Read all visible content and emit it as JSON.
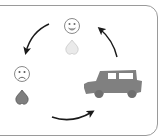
{
  "diagram": {
    "title": "",
    "nodes": [
      {
        "id": "happy",
        "label": "",
        "icons": [
          "smiley-face-icon",
          "heart-icon"
        ],
        "heart_color": "#e6e6e6",
        "position": "top"
      },
      {
        "id": "sad",
        "label": "",
        "icons": [
          "sad-face-icon",
          "heart-icon"
        ],
        "heart_color": "#7a7a7a",
        "position": "left"
      },
      {
        "id": "jeep",
        "label": "",
        "icons": [
          "jeep-icon"
        ],
        "vehicle_color": "#808080",
        "position": "right"
      }
    ],
    "edges": [
      {
        "from": "happy",
        "to": "sad",
        "direction": "counter-clockwise"
      },
      {
        "from": "sad",
        "to": "jeep"
      },
      {
        "from": "jeep",
        "to": "happy"
      }
    ],
    "colors": {
      "border": "#9a9a9a",
      "arrow": "#1a1a1a",
      "face_stroke": "#8a8a8a"
    }
  }
}
